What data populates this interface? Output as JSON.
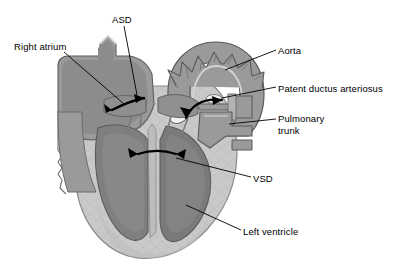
{
  "figure": {
    "background_color": "#ffffff",
    "text_color": "#000000"
  },
  "palette": {
    "myocardium_light": "#c9c9c9",
    "wall_mid": "#9a9a9a",
    "chamber_dark": "#7f7f7f",
    "chamber_darker": "#6e6e6e",
    "vessel_gray": "#8f8f8f",
    "highlight": "#e2e2e2",
    "outline": "#4a4a4a",
    "leader_line": "#000000"
  },
  "labels": [
    {
      "id": "asd",
      "text": "ASD",
      "x": 112,
      "y": 14,
      "lines": [
        "ASD"
      ]
    },
    {
      "id": "ra",
      "text": "Right atrium",
      "x": 14,
      "y": 41,
      "lines": [
        "Right atrium"
      ]
    },
    {
      "id": "aorta",
      "text": "Aorta",
      "x": 278,
      "y": 45,
      "lines": [
        "Aorta"
      ]
    },
    {
      "id": "pda",
      "text": "Patent ductus arteriosus",
      "x": 278,
      "y": 83,
      "lines": [
        "Patent ductus arteriosus"
      ]
    },
    {
      "id": "pt",
      "text": "Pulmonary trunk",
      "x": 278,
      "y": 113,
      "lines": [
        "Pulmonary",
        "trunk"
      ]
    },
    {
      "id": "vsd",
      "text": "VSD",
      "x": 253,
      "y": 173,
      "lines": [
        "VSD"
      ]
    },
    {
      "id": "lv",
      "text": "Left ventricle",
      "x": 243,
      "y": 226,
      "lines": [
        "Left ventricle"
      ]
    }
  ],
  "leader_lines": [
    {
      "id": "leader-asd",
      "from": [
        124,
        26
      ],
      "to": [
        137,
        95
      ]
    },
    {
      "id": "leader-ra",
      "from": [
        64,
        52
      ],
      "to": [
        124,
        104
      ]
    },
    {
      "id": "leader-aorta",
      "from": [
        276,
        50
      ],
      "to": [
        225,
        70
      ]
    },
    {
      "id": "leader-pda",
      "from": [
        276,
        87
      ],
      "to": [
        222,
        98
      ]
    },
    {
      "id": "leader-pt",
      "from": [
        276,
        119
      ],
      "to": [
        229,
        124
      ]
    },
    {
      "id": "leader-vsd",
      "from": [
        251,
        177
      ],
      "to": [
        176,
        158
      ]
    },
    {
      "id": "leader-lv",
      "from": [
        241,
        230
      ],
      "to": [
        186,
        205
      ]
    }
  ],
  "flow_arrows": [
    {
      "id": "arrow-asd",
      "description": "shunt arrow through atrial septal defect"
    },
    {
      "id": "arrow-pda",
      "description": "shunt arrow through patent ductus arteriosus"
    },
    {
      "id": "arrow-vsd",
      "description": "shunt arrow through ventricular septal defect"
    }
  ]
}
